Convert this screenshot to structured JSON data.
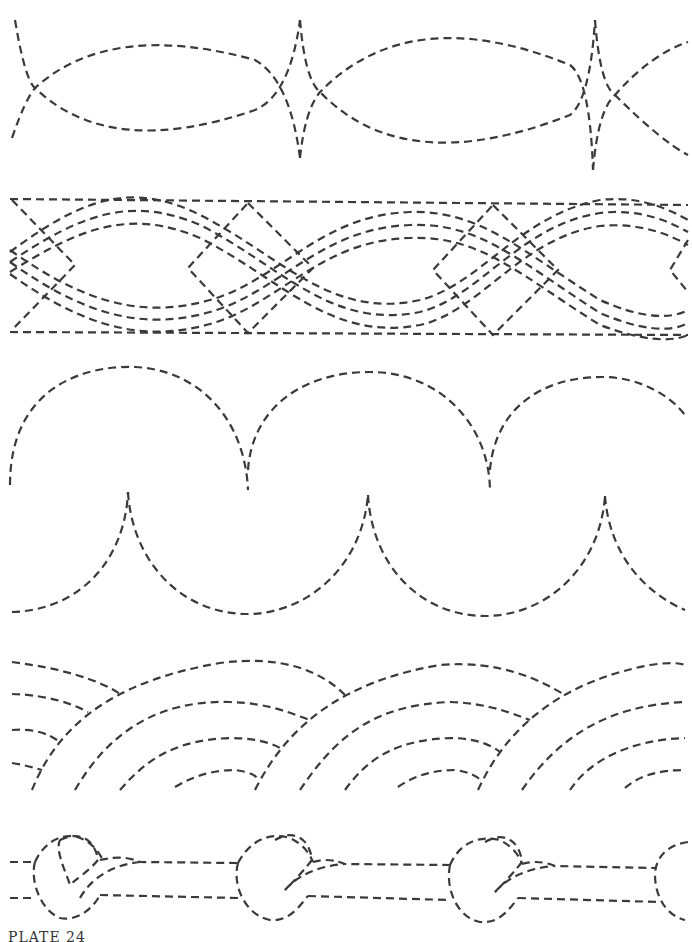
{
  "page": {
    "caption": "PLATE 24",
    "stroke_color": "#3a3a3a",
    "background": "#ffffff"
  },
  "patterns": [
    {
      "name": "pointed-oval-border",
      "description": "Interlaced pointed ovals (vesica) with cusps"
    },
    {
      "name": "cable-diamond-border",
      "description": "Triple wavy cable lines crossing through diamonds between two straight rails"
    },
    {
      "name": "scallop-border",
      "description": "Alternating upper and lower scallop arcs"
    },
    {
      "name": "overlapping-fan-border",
      "description": "Concentric overlapping fan arcs"
    },
    {
      "name": "knotted-rope-border",
      "description": "Twin rails with rope knots"
    }
  ]
}
